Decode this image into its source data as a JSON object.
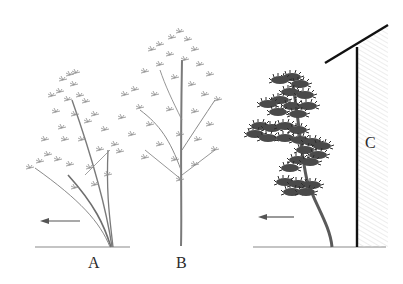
{
  "diagram": {
    "labels": {
      "a": "A",
      "b": "B",
      "c": "C"
    },
    "elements": {
      "tree_a": "multi-stemmed tree leaning, light feathery foliage",
      "tree_b": "upright single-trunk tree, open leafy crown",
      "tree_c": "tiered pine-like tree with curved trunk beside wall",
      "wall_c": "vertical wall with hatched shading and sloped roof line",
      "arrow_a": "left-pointing arrow",
      "arrow_c": "left-pointing arrow"
    },
    "colors": {
      "ground": "#8a8a8a",
      "foliage_light": "#9a9a9a",
      "foliage_dark": "#3a3a3a",
      "wall": "#111111",
      "hatch": "#e6e6e6"
    }
  }
}
